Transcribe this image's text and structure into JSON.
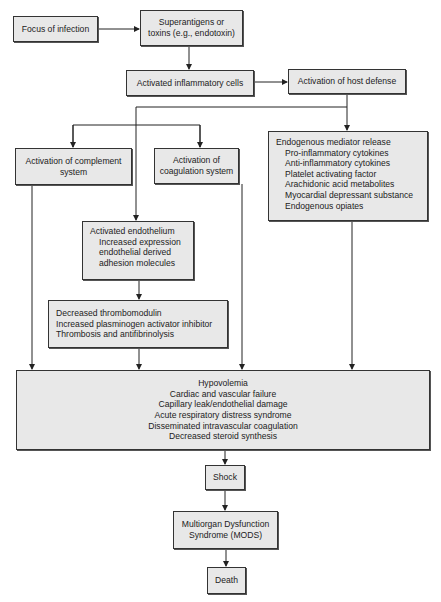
{
  "diagram": {
    "type": "flowchart",
    "nodes": {
      "focus": {
        "lines": [
          "Focus of infection"
        ]
      },
      "superantigens": {
        "lines": [
          "Superantigens or",
          "toxins (e.g., endotoxin)"
        ]
      },
      "inflammatory_cells": {
        "lines": [
          "Activated inflammatory cells"
        ]
      },
      "host_defense": {
        "lines": [
          "Activation of host defense"
        ]
      },
      "complement": {
        "lines": [
          "Activation of complement",
          "system"
        ]
      },
      "coagulation": {
        "lines": [
          "Activation of",
          "coagulation system"
        ]
      },
      "mediator": {
        "title": "Endogenous mediator release",
        "items": [
          "Pro-inflammatory cytokines",
          "Anti-inflammatory cytokines",
          "Platelet activating factor",
          "Arachidonic acid metabolites",
          "Myocardial depressant substance",
          "Endogenous opiates"
        ]
      },
      "endothelium": {
        "title": "Activated endothelium",
        "items": [
          "Increased expression",
          "endothelial derived",
          "adhesion molecules"
        ]
      },
      "thrombomodulin": {
        "lines": [
          "Decreased thrombomodulin",
          "Increased plasminogen activator inhibitor",
          "Thrombosis and antifibrinolysis"
        ]
      },
      "outcomes": {
        "lines": [
          "Hypovolemia",
          "Cardiac and vascular failure",
          "Capillary leak/endothelial damage",
          "Acute respiratory distress syndrome",
          "Disseminated intravascular coagulation",
          "Decreased steroid synthesis"
        ]
      },
      "shock": {
        "lines": [
          "Shock"
        ]
      },
      "mods": {
        "lines": [
          "Multiorgan Dysfunction",
          "Syndrome (MODS)"
        ]
      },
      "death": {
        "lines": [
          "Death"
        ]
      }
    },
    "edges": [
      [
        "focus",
        "superantigens"
      ],
      [
        "superantigens",
        "inflammatory_cells"
      ],
      [
        "inflammatory_cells",
        "host_defense"
      ],
      [
        "host_defense",
        "mediator"
      ],
      [
        "host_defense",
        "complement"
      ],
      [
        "host_defense",
        "coagulation"
      ],
      [
        "host_defense",
        "endothelium"
      ],
      [
        "endothelium",
        "thrombomodulin"
      ],
      [
        "complement",
        "outcomes"
      ],
      [
        "thrombomodulin",
        "outcomes"
      ],
      [
        "coagulation",
        "outcomes"
      ],
      [
        "mediator",
        "outcomes"
      ],
      [
        "outcomes",
        "shock"
      ],
      [
        "shock",
        "mods"
      ],
      [
        "mods",
        "death"
      ]
    ]
  }
}
